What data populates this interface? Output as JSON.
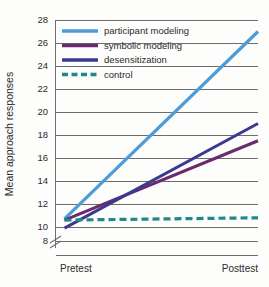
{
  "chart_data": {
    "type": "line",
    "title": "",
    "xlabel": "",
    "ylabel": "Mean approach responses",
    "categories": [
      "Pretest",
      "Posttest"
    ],
    "x": [
      0,
      1
    ],
    "ylim": [
      8,
      28
    ],
    "yticks": [
      8,
      10,
      12,
      14,
      16,
      18,
      20,
      22,
      24,
      26,
      28
    ],
    "ytick_labels": [
      "8",
      "10",
      "12",
      "14",
      "16",
      "18",
      "20",
      "22",
      "24",
      "26",
      "28"
    ],
    "axis_break": true,
    "axis_break_between": [
      8,
      10
    ],
    "grid": true,
    "grid_orientation": "horizontal",
    "legend_position": "upper-left-inside",
    "series": [
      {
        "name": "participant modeling",
        "values": [
          10.7,
          27.0
        ],
        "color": "#4d9bd8",
        "style": "solid",
        "width": 3.2
      },
      {
        "name": "symbolic modeling",
        "values": [
          10.6,
          17.5
        ],
        "color": "#6b2a6b",
        "style": "solid",
        "width": 3.0
      },
      {
        "name": "desensitization",
        "values": [
          9.9,
          19.0
        ],
        "color": "#3b3a8e",
        "style": "solid",
        "width": 3.0
      },
      {
        "name": "control",
        "values": [
          10.6,
          10.8
        ],
        "color": "#1f8a85",
        "style": "dashed",
        "width": 3.2
      }
    ]
  },
  "legend": {
    "items": [
      {
        "label": "participant modeling",
        "color": "#4d9bd8",
        "style": "solid"
      },
      {
        "label": "symbolic modeling",
        "color": "#6b2a6b",
        "style": "solid"
      },
      {
        "label": "desensitization",
        "color": "#3b3a8e",
        "style": "solid"
      },
      {
        "label": "control",
        "color": "#1f8a85",
        "style": "dashed"
      }
    ]
  },
  "axes": {
    "y_title": "Mean approach responses",
    "x_labels": [
      "Pretest",
      "Posttest"
    ]
  },
  "colors": {
    "axis": "#6e6e6e",
    "grid": "#6e6e6e",
    "text": "#2b2b2b",
    "background": "#fdfdfb"
  }
}
